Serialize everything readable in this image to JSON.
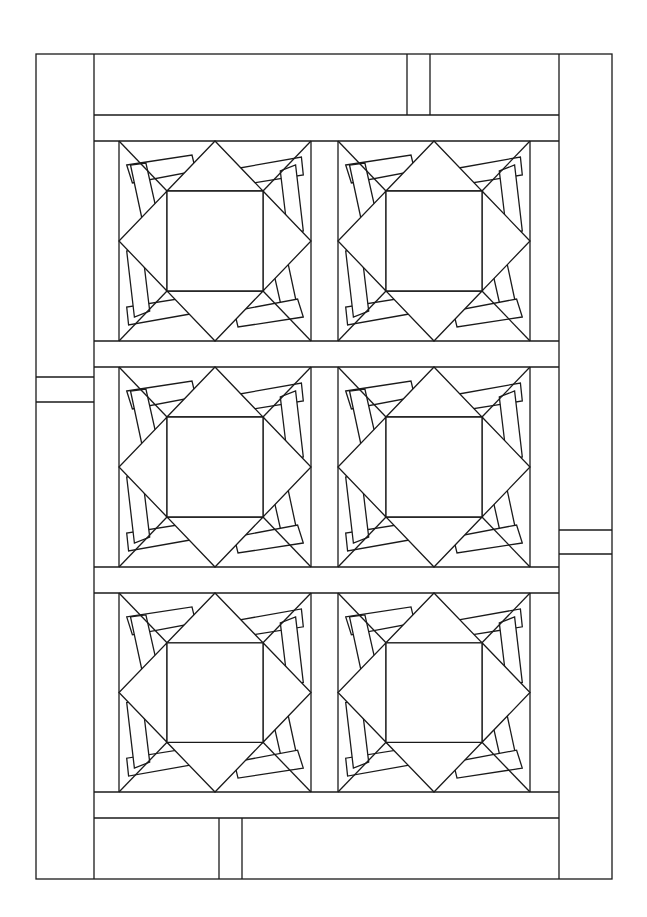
{
  "canvas": {
    "width": 647,
    "height": 917,
    "background": "#ffffff",
    "line_color": "#1a1a1a"
  },
  "frame": {
    "x1": 36,
    "y1": 54,
    "x2": 612,
    "y2": 879
  },
  "borders": {
    "left": {
      "x1": 36,
      "x2": 94,
      "dividers_y": [
        377,
        402
      ]
    },
    "right": {
      "x1": 559,
      "x2": 612,
      "dividers_y": [
        530,
        554
      ]
    },
    "top": {
      "y1": 54,
      "y2": 115,
      "strip_x": [
        407,
        430
      ]
    },
    "bottom": {
      "y1": 818,
      "y2": 879,
      "strip_x": [
        219,
        242
      ]
    }
  },
  "sashing_rows": [
    {
      "y1": 115,
      "y2": 141
    },
    {
      "y1": 341,
      "y2": 367
    },
    {
      "y1": 567,
      "y2": 593
    },
    {
      "y1": 792,
      "y2": 818
    }
  ],
  "inner_x": [
    94,
    559
  ],
  "blocks": {
    "columns": [
      {
        "x1": 119,
        "x2": 311
      },
      {
        "x1": 338,
        "x2": 530
      }
    ],
    "rows": [
      {
        "y1": 141,
        "y2": 341
      },
      {
        "y1": 367,
        "y2": 567
      },
      {
        "y1": 593,
        "y2": 792
      }
    ],
    "count": 6,
    "pattern": "square-in-star with rotated rectangles"
  }
}
